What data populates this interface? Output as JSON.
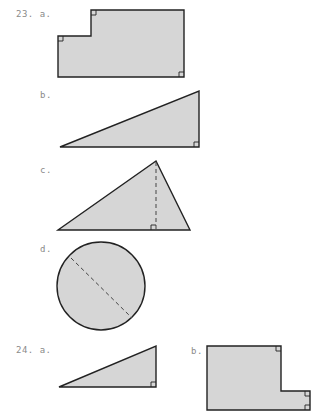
{
  "problems": [
    {
      "number": "23.",
      "parts": [
        {
          "letter": "a.",
          "figure": "L-shaped polygon with right angles",
          "right_angle_marks": 3
        },
        {
          "letter": "b.",
          "figure": "right triangle",
          "right_angle_marks": 1
        },
        {
          "letter": "c.",
          "figure": "triangle with dashed altitude",
          "right_angle_marks": 1
        },
        {
          "letter": "d.",
          "figure": "circle with dashed diameter",
          "right_angle_marks": 0
        }
      ]
    },
    {
      "number": "24.",
      "parts": [
        {
          "letter": "a.",
          "figure": "right triangle",
          "right_angle_marks": 1
        },
        {
          "letter": "b.",
          "figure": "L-shaped polygon with right angles",
          "right_angle_marks": 3
        }
      ]
    }
  ],
  "labels": {
    "p23a": "23. a.",
    "p23b": "b.",
    "p23c": "c.",
    "p23d": "d.",
    "p24a": "24. a.",
    "p24b": "b."
  },
  "colors": {
    "fill": "#d6d6d6",
    "stroke": "#222222",
    "label": "#8a8a8a"
  }
}
